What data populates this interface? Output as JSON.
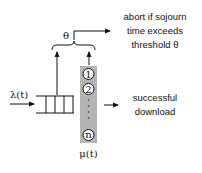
{
  "diagram": {
    "arrival_label": "λ(t)",
    "service_label": "μ(t)",
    "threshold_label": "θ",
    "servers": [
      "1",
      "2",
      "n"
    ],
    "abort_text": [
      "abort if sojourn",
      "time exceeds",
      "threshold θ"
    ],
    "success_text": [
      "successful",
      "download"
    ],
    "colors": {
      "server_column": "#b4b4b4",
      "line": "#111111",
      "background": "#ffffff"
    }
  }
}
